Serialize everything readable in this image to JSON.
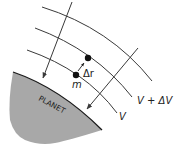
{
  "diagram": {
    "planet_label": "PLANET",
    "labels": {
      "potential_outer": "V + ΔV",
      "potential_inner": "V",
      "mass": "m",
      "displacement": "Δr"
    },
    "colors": {
      "line": "#3a3a3a",
      "planet_fill": "#a8a8a8",
      "planet_edge": "#1a1a1a",
      "text": "#222222",
      "background": "#ffffff"
    },
    "elements": {
      "equipotential_lines": 3,
      "field_arrows": 2,
      "points": [
        "m",
        "m displaced by Δr"
      ]
    }
  }
}
